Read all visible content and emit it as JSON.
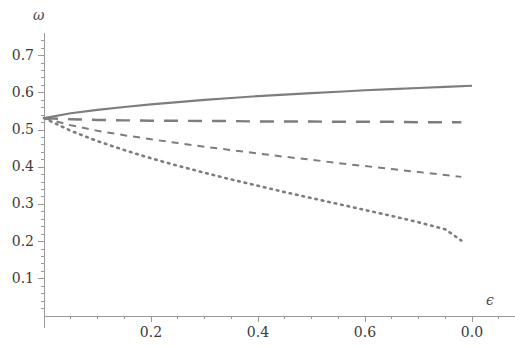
{
  "chart_data": {
    "type": "line",
    "title": "",
    "subtitle": "",
    "xlabel": "ϵ",
    "ylabel": "ω",
    "grid": false,
    "legend": "none",
    "xlim": [
      0,
      0.88
    ],
    "ylim": [
      0,
      0.76
    ],
    "xticks": [
      0.2,
      0.4,
      0.6,
      0.8
    ],
    "xtick_labels": [
      "0.2",
      "0.4",
      "0.6",
      "0.0"
    ],
    "yticks": [
      0.1,
      0.2,
      0.3,
      0.4,
      0.5,
      0.6,
      0.7
    ],
    "ytick_labels": [
      "0.1",
      "0.2",
      "0.3",
      "0.4",
      "0.5",
      "0.6",
      "0.7"
    ],
    "x_minor_per_interval": 4,
    "y_minor_per_interval": 5,
    "axis_color": "#9a9a9a",
    "tick_label_color": "#3a3a3a",
    "line_color": "#7d7d7d",
    "series": [
      {
        "name": "solid",
        "style": "solid",
        "dash": "",
        "width": 2.1,
        "x": [
          0.0,
          0.05,
          0.1,
          0.15,
          0.2,
          0.25,
          0.3,
          0.35,
          0.4,
          0.45,
          0.5,
          0.55,
          0.6,
          0.65,
          0.7,
          0.75,
          0.8
        ],
        "y": [
          0.532,
          0.545,
          0.554,
          0.562,
          0.569,
          0.575,
          0.581,
          0.586,
          0.591,
          0.595,
          0.599,
          0.603,
          0.607,
          0.61,
          0.613,
          0.616,
          0.619
        ]
      },
      {
        "name": "long-dashed",
        "style": "long-dash",
        "dash": "14,10",
        "width": 2.4,
        "x": [
          0.0,
          0.05,
          0.1,
          0.15,
          0.2,
          0.25,
          0.3,
          0.35,
          0.4,
          0.45,
          0.5,
          0.55,
          0.6,
          0.65,
          0.7,
          0.75,
          0.78
        ],
        "y": [
          0.532,
          0.529,
          0.527,
          0.526,
          0.525,
          0.525,
          0.524,
          0.524,
          0.523,
          0.523,
          0.523,
          0.522,
          0.522,
          0.522,
          0.521,
          0.521,
          0.521
        ]
      },
      {
        "name": "medium-dashed",
        "style": "dash",
        "dash": "7,6",
        "width": 2.0,
        "x": [
          0.0,
          0.05,
          0.1,
          0.15,
          0.2,
          0.25,
          0.3,
          0.35,
          0.4,
          0.45,
          0.5,
          0.55,
          0.6,
          0.65,
          0.7,
          0.75,
          0.78
        ],
        "y": [
          0.532,
          0.513,
          0.498,
          0.486,
          0.475,
          0.465,
          0.455,
          0.446,
          0.437,
          0.428,
          0.42,
          0.411,
          0.403,
          0.395,
          0.387,
          0.379,
          0.374
        ]
      },
      {
        "name": "dotted",
        "style": "dot",
        "dash": "1.6,5",
        "width": 2.6,
        "x": [
          0.0,
          0.05,
          0.1,
          0.15,
          0.2,
          0.25,
          0.3,
          0.35,
          0.4,
          0.45,
          0.5,
          0.55,
          0.6,
          0.65,
          0.7,
          0.75,
          0.78
        ],
        "y": [
          0.532,
          0.498,
          0.47,
          0.446,
          0.424,
          0.404,
          0.385,
          0.367,
          0.35,
          0.333,
          0.317,
          0.301,
          0.285,
          0.269,
          0.252,
          0.233,
          0.203
        ]
      }
    ]
  },
  "axes": {
    "y_axis_label": "ω",
    "x_axis_label": "ϵ"
  }
}
